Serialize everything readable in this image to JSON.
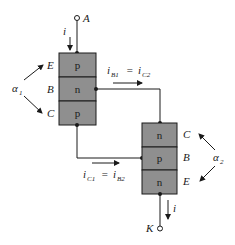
{
  "colors": {
    "block_fill": "#8f8f8f",
    "stroke": "#1a1a1a",
    "background": "#ffffff"
  },
  "terminals": {
    "anode": "A",
    "cathode": "K"
  },
  "current_label": "i",
  "transistor1": {
    "layers": [
      "p",
      "n",
      "p"
    ],
    "pins": [
      "E",
      "B",
      "C"
    ],
    "alpha": "α",
    "alpha_sub": "1"
  },
  "transistor2": {
    "layers": [
      "n",
      "p",
      "n"
    ],
    "pins": [
      "C",
      "B",
      "E"
    ],
    "alpha": "α",
    "alpha_sub": "2"
  },
  "currents": {
    "ib1_ic2": {
      "i1": "i",
      "s1": "B1",
      "eq": "=",
      "i2": "i",
      "s2": "C2"
    },
    "ic1_ib2": {
      "i1": "i",
      "s1": "C1",
      "eq": "=",
      "i2": "i",
      "s2": "B2"
    }
  }
}
